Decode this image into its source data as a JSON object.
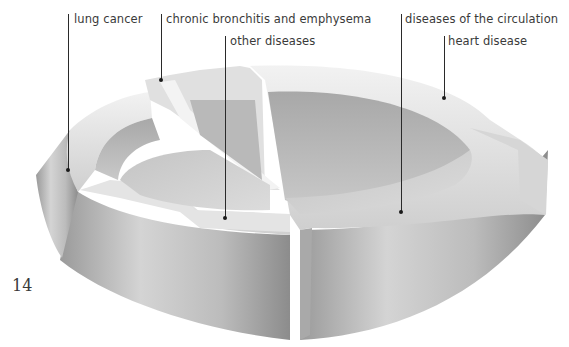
{
  "figure": {
    "type": "3d-exploded-pie-ring",
    "page_number": "14",
    "labels": [
      {
        "id": "lung-cancer",
        "text": "lung cancer"
      },
      {
        "id": "chronic-bronchitis",
        "text": "chronic bronchitis and emphysema"
      },
      {
        "id": "other-diseases",
        "text": "other diseases"
      },
      {
        "id": "circulation",
        "text": "diseases of the circulation"
      },
      {
        "id": "heart-disease",
        "text": "heart disease"
      }
    ]
  },
  "colors": {
    "background": "#ffffff",
    "text": "#3a3a3a",
    "surface_light": "#e6e6e6",
    "surface_mid": "#bdbdbd",
    "surface_dark": "#8f8f8f",
    "leader": "#2a2a2a"
  }
}
